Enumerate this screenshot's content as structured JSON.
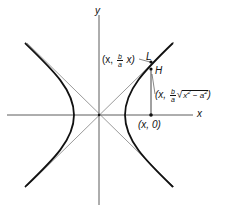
{
  "figure": {
    "type": "hyperbola-with-asymptotes",
    "axes": {
      "x_label": "x",
      "y_label": "y"
    },
    "points": {
      "L": {
        "label": "L",
        "coord_prefix": "(x, ",
        "frac_num": "b",
        "frac_den": "a",
        "coord_suffix": " x)"
      },
      "H": {
        "label": "H",
        "coord_prefix": "(x, ",
        "frac_num": "b",
        "frac_den": "a",
        "radicand": "x",
        "radicand_exp": "2",
        "minus": " − a",
        "minus_exp": "2",
        "coord_suffix": ")"
      },
      "base": {
        "label": "(x, 0)"
      }
    },
    "colors": {
      "curve": "#111111",
      "asymptote": "#555555",
      "axis": "#333333",
      "background": "#ffffff"
    }
  }
}
